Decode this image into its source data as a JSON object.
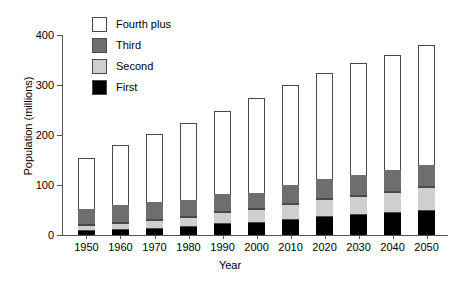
{
  "chart_data": {
    "type": "bar",
    "subtype": "stacked-bar",
    "title": "",
    "xlabel": "Year",
    "ylabel": "Population (millions)",
    "categories": [
      "1950",
      "1960",
      "1970",
      "1980",
      "1990",
      "2000",
      "2010",
      "2020",
      "2030",
      "2040",
      "2050"
    ],
    "series": [
      {
        "name": "First",
        "color": "#000000",
        "values": [
          8,
          10,
          13,
          16,
          22,
          25,
          30,
          37,
          40,
          44,
          49
        ]
      },
      {
        "name": "Second",
        "color": "#cfcfcf",
        "values": [
          12,
          14,
          17,
          21,
          24,
          27,
          32,
          36,
          39,
          43,
          47
        ]
      },
      {
        "name": "Third",
        "color": "#6e6e6e",
        "values": [
          33,
          37,
          37,
          34,
          36,
          33,
          38,
          40,
          41,
          43,
          44
        ]
      },
      {
        "name": "Fourth plus",
        "color": "#ffffff",
        "values": [
          102,
          119,
          136,
          154,
          167,
          189,
          200,
          212,
          225,
          230,
          240
        ]
      }
    ],
    "totals": [
      155,
      180,
      203,
      225,
      249,
      274,
      300,
      325,
      345,
      360,
      380
    ],
    "ylim": [
      0,
      400
    ],
    "yticks": [
      0,
      100,
      200,
      300,
      400
    ],
    "ytick_labels": [
      "0",
      "100",
      "200",
      "300",
      "400"
    ],
    "grid": false,
    "legend_position": "top-left",
    "legend_order": [
      "Fourth plus",
      "Third",
      "Second",
      "First"
    ]
  },
  "legend": {
    "items": [
      {
        "label": "Fourth plus",
        "color": "#ffffff"
      },
      {
        "label": "Third",
        "color": "#6e6e6e"
      },
      {
        "label": "Second",
        "color": "#cfcfcf"
      },
      {
        "label": "First",
        "color": "#000000"
      }
    ]
  }
}
